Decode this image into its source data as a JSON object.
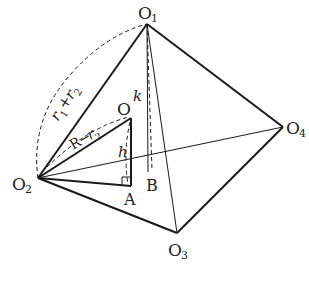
{
  "diagram": {
    "type": "geometry-tetrahedron",
    "stroke_color": "#1a1a1a",
    "points": {
      "O1": {
        "x": 147,
        "y": 24
      },
      "O2": {
        "x": 38,
        "y": 178
      },
      "O3": {
        "x": 177,
        "y": 233
      },
      "O4": {
        "x": 283,
        "y": 127
      },
      "O": {
        "x": 131,
        "y": 118
      },
      "A": {
        "x": 131,
        "y": 186
      },
      "B": {
        "x": 150,
        "y": 172
      }
    },
    "labels": {
      "O1": {
        "main": "O",
        "sub": "1"
      },
      "O2": {
        "main": "O",
        "sub": "2"
      },
      "O3": {
        "main": "O",
        "sub": "3"
      },
      "O4": {
        "main": "O",
        "sub": "4"
      },
      "O": "O",
      "A": "A",
      "B": "B",
      "k": "k",
      "h": "h",
      "r1_plus_r2": {
        "r1": "r",
        "s1": "1",
        "plus": "+",
        "r2": "r",
        "s2": "2"
      },
      "R_minus_r2": {
        "R": "R",
        "minus": "−",
        "r": "r",
        "s": "2"
      }
    }
  }
}
